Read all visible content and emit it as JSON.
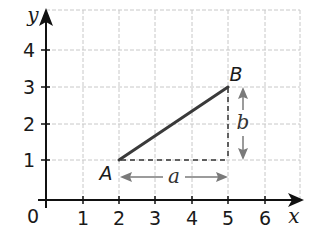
{
  "diagram": {
    "type": "coordinate-grid-line-segment",
    "axes": {
      "x_label": "x",
      "y_label": "y",
      "origin_label": "0",
      "x_ticks": [
        "1",
        "2",
        "3",
        "4",
        "5",
        "6"
      ],
      "y_ticks": [
        "1",
        "2",
        "3",
        "4"
      ]
    },
    "points": [
      {
        "name": "A",
        "x": 2,
        "y": 1
      },
      {
        "name": "B",
        "x": 5,
        "y": 3
      }
    ],
    "segment": {
      "from": "A",
      "to": "B",
      "color": "#3a3a3a"
    },
    "dimensions": {
      "horizontal": {
        "label": "a",
        "from_x": 2,
        "to_x": 5
      },
      "vertical": {
        "label": "b",
        "from_y": 1,
        "to_y": 3
      }
    },
    "colors": {
      "grid": "#c8c8c8",
      "axis": "#111111",
      "segment": "#3a3a3a",
      "dimension_arrows": "#7a7a7a"
    }
  }
}
